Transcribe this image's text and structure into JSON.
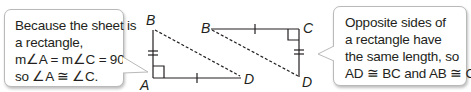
{
  "left_callout": {
    "lines": [
      "Because the sheet is",
      "a rectangle,",
      "m∠A = m∠C = 90,",
      "so ∠A ≅ ∠C."
    ]
  },
  "right_callout": {
    "lines": [
      "Opposite sides of",
      "a rectangle have",
      "the same length, so",
      "AD ≅ BC and AB ≅ CD."
    ]
  },
  "triangle_left": {
    "vertices": {
      "top": "B",
      "bottom_left": "A",
      "bottom_right": "D"
    },
    "right_angle_at": "A",
    "marks": {
      "AB": "double-tick",
      "AD": "single-tick"
    },
    "diagonal": "BD (dashed)"
  },
  "triangle_right": {
    "vertices": {
      "top_left": "B",
      "top_right": "C",
      "bottom_right": "D"
    },
    "right_angle_at": "C",
    "marks": {
      "BC": "single-tick",
      "CD": "double-tick"
    },
    "diagonal": "BD (dashed)"
  },
  "colors": {
    "line": "#231f20",
    "callout_border": "#b9b9b9"
  }
}
